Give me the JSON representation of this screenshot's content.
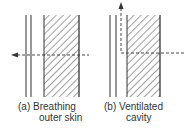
{
  "figures": [
    {
      "id": "a",
      "label": "(a)",
      "caption_line1": "Breathing",
      "caption_line2": "outer skin",
      "flow": "horizontal dashed arrow passing outward through wall"
    },
    {
      "id": "b",
      "label": "(b)",
      "caption_line1": "Ventilated",
      "caption_line2": "cavity",
      "flow": "dashed arrow enters cavity then rises upward"
    }
  ],
  "colors": {
    "line": "#333333",
    "hatch": "#444444",
    "background": "#ffffff"
  }
}
